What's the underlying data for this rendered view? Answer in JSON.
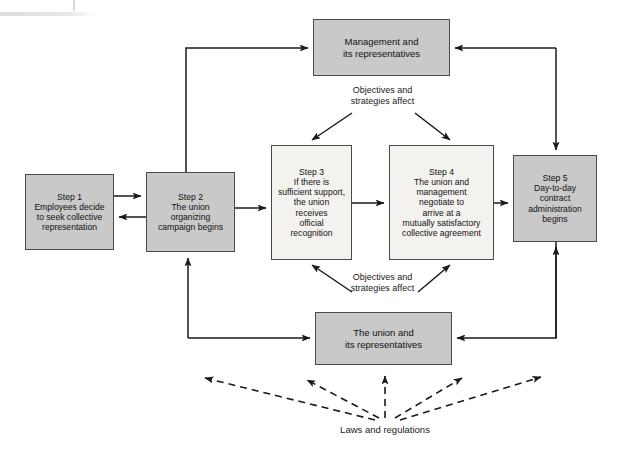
{
  "diagram": {
    "nodes": {
      "management": "Management and\nits representatives",
      "union": "The union and\nits representatives",
      "step1": "Step 1\nEmployees decide\nto seek collective\nrepresentation",
      "step2": "Step 2\nThe union\norganizing\ncampaign begins",
      "step3": "Step 3\nIf there is\nsufficient support,\nthe union\nreceives\nofficial\nrecognition",
      "step4": "Step 4\nThe union and\nmanagement\nnegotiate to\narrive at a\nmutually satisfactory\ncollective agreement",
      "step5": "Step 5\nDay-to-day\ncontract\nadministration\nbegins"
    },
    "labels": {
      "objectives_top": "Objectives and\nstrategies affect",
      "objectives_bottom": "Objectives and\nstrategies affect",
      "laws": "Laws and regulations"
    },
    "colors": {
      "node_fill_gray": "#c9c9c9",
      "node_fill_light": "#f4f2ee",
      "node_border": "#4a4a4a",
      "edge": "#1a1a1a",
      "text": "#111111",
      "background": "#ffffff"
    },
    "edges": [
      {
        "from": "step1",
        "to": "step2",
        "style": "solid",
        "direction": "forward"
      },
      {
        "from": "step2",
        "to": "step1",
        "style": "solid",
        "direction": "forward"
      },
      {
        "from": "step2",
        "to": "step3",
        "style": "solid",
        "direction": "forward"
      },
      {
        "from": "step3",
        "to": "step4",
        "style": "solid",
        "direction": "forward"
      },
      {
        "from": "step4",
        "to": "step5",
        "style": "solid",
        "direction": "forward"
      },
      {
        "from": "step2",
        "to": "management",
        "style": "solid",
        "direction": "forward"
      },
      {
        "from": "step5",
        "to": "management",
        "style": "solid",
        "direction": "reverse"
      },
      {
        "from": "union",
        "to": "step2",
        "style": "solid",
        "direction": "forward"
      },
      {
        "from": "step5",
        "to": "union",
        "style": "solid",
        "direction": "forward"
      },
      {
        "from": "management",
        "to": "step3",
        "style": "solid",
        "direction": "forward"
      },
      {
        "from": "management",
        "to": "step4",
        "style": "solid",
        "direction": "forward"
      },
      {
        "from": "union",
        "to": "step3",
        "style": "solid",
        "direction": "forward"
      },
      {
        "from": "union",
        "to": "step4",
        "style": "solid",
        "direction": "forward"
      },
      {
        "from": "laws",
        "to": "step2-left",
        "style": "dashed",
        "direction": "forward"
      },
      {
        "from": "laws",
        "to": "union-left",
        "style": "dashed",
        "direction": "forward"
      },
      {
        "from": "laws",
        "to": "union-center",
        "style": "dashed",
        "direction": "forward"
      },
      {
        "from": "laws",
        "to": "union-right",
        "style": "dashed",
        "direction": "forward"
      },
      {
        "from": "laws",
        "to": "step5-right",
        "style": "dashed",
        "direction": "forward"
      }
    ]
  }
}
